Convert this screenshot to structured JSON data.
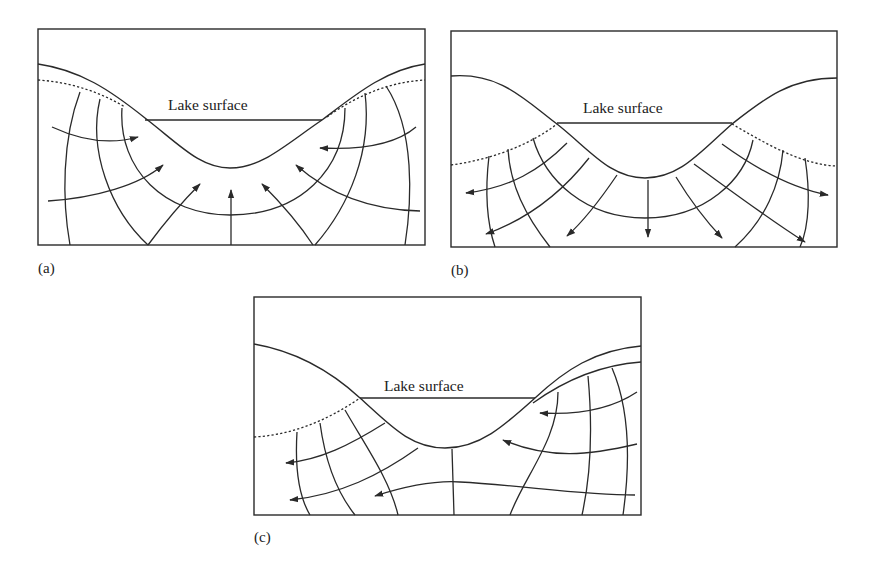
{
  "figure": {
    "colors": {
      "line": "#2a2a2a",
      "background": "#ffffff"
    },
    "panels": [
      {
        "id": "a",
        "label": "(a)",
        "lake_label": "Lake surface",
        "flow_direction": "into lake (discharge)"
      },
      {
        "id": "b",
        "label": "(b)",
        "lake_label": "Lake surface",
        "flow_direction": "out of lake (recharge)"
      },
      {
        "id": "c",
        "label": "(c)",
        "lake_label": "Lake surface",
        "flow_direction": "through lake, right to left"
      }
    ],
    "legend_implied": {
      "solid_curve": "land surface / lake bed",
      "dotted_curve": "water table",
      "thin_lines": "equipotential lines",
      "arrows": "groundwater flow lines"
    }
  }
}
